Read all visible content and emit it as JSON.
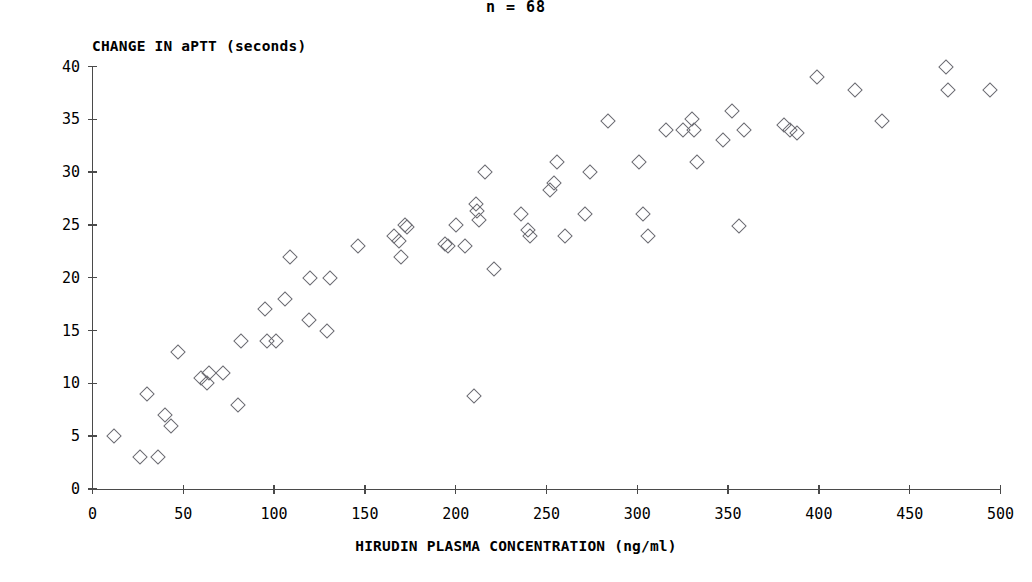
{
  "chart_data": {
    "type": "scatter",
    "title": "n = 68",
    "xlabel": "HIRUDIN PLASMA CONCENTRATION (ng/ml)",
    "ylabel": "CHANGE IN aPTT (seconds)",
    "xlim": [
      0,
      500
    ],
    "ylim": [
      0,
      40
    ],
    "xticks": [
      0,
      50,
      100,
      150,
      200,
      250,
      300,
      350,
      400,
      450,
      500
    ],
    "yticks": [
      0,
      5,
      10,
      15,
      20,
      25,
      30,
      35,
      40
    ],
    "grid": false,
    "legend": null,
    "marker": "open-diamond",
    "marker_color": "#6b6b72",
    "n": 68,
    "points": [
      [
        12,
        5.0
      ],
      [
        26,
        3.0
      ],
      [
        36,
        3.0
      ],
      [
        30,
        9.0
      ],
      [
        40,
        7.0
      ],
      [
        43,
        6.0
      ],
      [
        47,
        13.0
      ],
      [
        60,
        10.5
      ],
      [
        64,
        11.0
      ],
      [
        63,
        10.0
      ],
      [
        72,
        11.0
      ],
      [
        80,
        8.0
      ],
      [
        82,
        14.0
      ],
      [
        95,
        17.0
      ],
      [
        96,
        14.0
      ],
      [
        101,
        14.0
      ],
      [
        106,
        18.0
      ],
      [
        109,
        22.0
      ],
      [
        119,
        16.0
      ],
      [
        120,
        20.0
      ],
      [
        129,
        15.0
      ],
      [
        131,
        20.0
      ],
      [
        146,
        23.0
      ],
      [
        166,
        24.0
      ],
      [
        169,
        23.5
      ],
      [
        170,
        22.0
      ],
      [
        172,
        25.0
      ],
      [
        173,
        24.8
      ],
      [
        194,
        23.2
      ],
      [
        196,
        23.0
      ],
      [
        200,
        25.0
      ],
      [
        205,
        23.0
      ],
      [
        210,
        8.8
      ],
      [
        211,
        27.0
      ],
      [
        212,
        26.3
      ],
      [
        213,
        25.5
      ],
      [
        216,
        30.0
      ],
      [
        221,
        20.8
      ],
      [
        236,
        26.0
      ],
      [
        240,
        24.5
      ],
      [
        241,
        24.0
      ],
      [
        252,
        28.3
      ],
      [
        254,
        29.0
      ],
      [
        256,
        31.0
      ],
      [
        260,
        24.0
      ],
      [
        271,
        26.0
      ],
      [
        274,
        30.0
      ],
      [
        284,
        34.8
      ],
      [
        301,
        31.0
      ],
      [
        303,
        26.0
      ],
      [
        306,
        24.0
      ],
      [
        316,
        34.0
      ],
      [
        325,
        34.0
      ],
      [
        330,
        35.0
      ],
      [
        331,
        34.0
      ],
      [
        333,
        31.0
      ],
      [
        347,
        33.0
      ],
      [
        352,
        35.8
      ],
      [
        356,
        24.9
      ],
      [
        359,
        34.0
      ],
      [
        381,
        34.5
      ],
      [
        384,
        34.0
      ],
      [
        388,
        33.7
      ],
      [
        399,
        39.0
      ],
      [
        420,
        37.8
      ],
      [
        435,
        34.8
      ],
      [
        470,
        40.0
      ],
      [
        471,
        37.8
      ],
      [
        494,
        37.8
      ]
    ]
  }
}
